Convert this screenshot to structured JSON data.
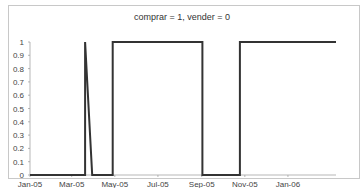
{
  "chart_data": {
    "type": "line",
    "title": "comprar = 1, vender = 0",
    "xlabel": "",
    "ylabel": "",
    "ylim": [
      0,
      1
    ],
    "yticks": [
      "0",
      "0.1",
      "0.2",
      "0.3",
      "0.4",
      "0.5",
      "0.6",
      "0.7",
      "0.8",
      "0.9",
      "1"
    ],
    "xticks": [
      "Jan-05",
      "Mar-05",
      "May-05",
      "Jul-05",
      "Sep-05",
      "Nov-05",
      "Jan-06"
    ],
    "grid": false,
    "legend": "none",
    "series": [
      {
        "name": "signal",
        "points": [
          {
            "x": "Jan-05",
            "y": 0
          },
          {
            "x": "2005-03-20",
            "y": 0
          },
          {
            "x": "2005-03-20",
            "y": 1
          },
          {
            "x": "2005-03-30",
            "y": 0
          },
          {
            "x": "2005-04-28",
            "y": 0
          },
          {
            "x": "2005-04-28",
            "y": 1
          },
          {
            "x": "2005-09-02",
            "y": 1
          },
          {
            "x": "2005-09-02",
            "y": 0
          },
          {
            "x": "2005-10-25",
            "y": 0
          },
          {
            "x": "2005-10-25",
            "y": 1
          },
          {
            "x": "2006-03-10",
            "y": 1
          }
        ]
      }
    ]
  }
}
